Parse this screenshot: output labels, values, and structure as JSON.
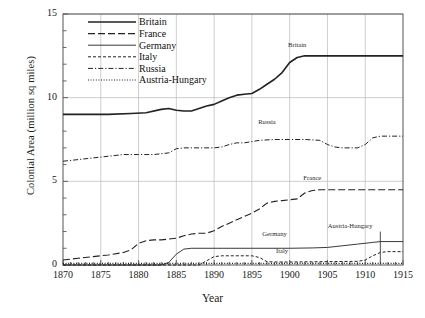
{
  "chart_data": {
    "type": "line",
    "title": "",
    "xlabel": "Year",
    "ylabel": "Colonial Area (million sq miles)",
    "xlim": [
      1870,
      1915
    ],
    "ylim": [
      0,
      15
    ],
    "xticks": [
      1870,
      1875,
      1880,
      1885,
      1890,
      1895,
      1900,
      1905,
      1910,
      1915
    ],
    "yticks": [
      0,
      5,
      10,
      15
    ],
    "yminor_step": 1,
    "grid": "vertical-and-horizontal-major",
    "legend_position": "top-left-inside",
    "series": [
      {
        "name": "Britain",
        "style": "solid-thick",
        "annotation": "Britain",
        "points": [
          [
            1870,
            9.0
          ],
          [
            1873,
            9.0
          ],
          [
            1876,
            9.0
          ],
          [
            1879,
            9.05
          ],
          [
            1881,
            9.1
          ],
          [
            1883,
            9.3
          ],
          [
            1884,
            9.35
          ],
          [
            1885,
            9.25
          ],
          [
            1886,
            9.2
          ],
          [
            1887,
            9.2
          ],
          [
            1888,
            9.35
          ],
          [
            1889,
            9.5
          ],
          [
            1890,
            9.6
          ],
          [
            1891,
            9.8
          ],
          [
            1892,
            10.0
          ],
          [
            1893,
            10.15
          ],
          [
            1894,
            10.2
          ],
          [
            1895,
            10.25
          ],
          [
            1896,
            10.5
          ],
          [
            1897,
            10.8
          ],
          [
            1898,
            11.1
          ],
          [
            1899,
            11.5
          ],
          [
            1900,
            12.1
          ],
          [
            1901,
            12.4
          ],
          [
            1902,
            12.5
          ],
          [
            1905,
            12.5
          ],
          [
            1910,
            12.5
          ],
          [
            1915,
            12.5
          ]
        ]
      },
      {
        "name": "France",
        "style": "long-dash",
        "annotation": "France",
        "points": [
          [
            1870,
            0.3
          ],
          [
            1872,
            0.4
          ],
          [
            1874,
            0.5
          ],
          [
            1876,
            0.6
          ],
          [
            1878,
            0.75
          ],
          [
            1879,
            0.9
          ],
          [
            1880,
            1.3
          ],
          [
            1881,
            1.45
          ],
          [
            1882,
            1.5
          ],
          [
            1883,
            1.5
          ],
          [
            1884,
            1.55
          ],
          [
            1885,
            1.6
          ],
          [
            1886,
            1.75
          ],
          [
            1887,
            1.85
          ],
          [
            1888,
            1.9
          ],
          [
            1889,
            1.9
          ],
          [
            1890,
            2.05
          ],
          [
            1891,
            2.3
          ],
          [
            1892,
            2.5
          ],
          [
            1893,
            2.7
          ],
          [
            1894,
            2.9
          ],
          [
            1895,
            3.1
          ],
          [
            1896,
            3.35
          ],
          [
            1897,
            3.7
          ],
          [
            1898,
            3.8
          ],
          [
            1899,
            3.85
          ],
          [
            1900,
            3.9
          ],
          [
            1901,
            3.95
          ],
          [
            1902,
            4.3
          ],
          [
            1903,
            4.45
          ],
          [
            1904,
            4.5
          ],
          [
            1906,
            4.5
          ],
          [
            1910,
            4.5
          ],
          [
            1915,
            4.5
          ]
        ]
      },
      {
        "name": "Germany",
        "style": "solid-thin",
        "annotation": "Germany",
        "points": [
          [
            1870,
            0.0
          ],
          [
            1883,
            0.0
          ],
          [
            1884,
            0.15
          ],
          [
            1885,
            0.65
          ],
          [
            1886,
            0.95
          ],
          [
            1887,
            1.0
          ],
          [
            1890,
            1.0
          ],
          [
            1895,
            1.0
          ],
          [
            1900,
            1.0
          ],
          [
            1903,
            1.02
          ],
          [
            1905,
            1.05
          ],
          [
            1907,
            1.15
          ],
          [
            1909,
            1.25
          ],
          [
            1911,
            1.35
          ],
          [
            1912,
            1.4
          ],
          [
            1915,
            1.4
          ]
        ]
      },
      {
        "name": "Italy",
        "style": "short-dash",
        "annotation": "Italy",
        "points": [
          [
            1870,
            0.0
          ],
          [
            1888,
            0.0
          ],
          [
            1889,
            0.25
          ],
          [
            1890,
            0.5
          ],
          [
            1891,
            0.55
          ],
          [
            1894,
            0.55
          ],
          [
            1895,
            0.55
          ],
          [
            1896,
            0.45
          ],
          [
            1897,
            0.2
          ],
          [
            1898,
            0.18
          ],
          [
            1900,
            0.18
          ],
          [
            1905,
            0.2
          ],
          [
            1909,
            0.22
          ],
          [
            1910,
            0.3
          ],
          [
            1911,
            0.55
          ],
          [
            1912,
            0.75
          ],
          [
            1913,
            0.8
          ],
          [
            1915,
            0.8
          ]
        ]
      },
      {
        "name": "Russia",
        "style": "dash-dot",
        "annotation": "Russia",
        "points": [
          [
            1870,
            6.2
          ],
          [
            1872,
            6.3
          ],
          [
            1874,
            6.4
          ],
          [
            1876,
            6.5
          ],
          [
            1878,
            6.6
          ],
          [
            1880,
            6.6
          ],
          [
            1882,
            6.6
          ],
          [
            1884,
            6.7
          ],
          [
            1885,
            6.95
          ],
          [
            1886,
            7.0
          ],
          [
            1888,
            7.0
          ],
          [
            1890,
            7.0
          ],
          [
            1891,
            7.05
          ],
          [
            1892,
            7.2
          ],
          [
            1893,
            7.3
          ],
          [
            1894,
            7.3
          ],
          [
            1896,
            7.45
          ],
          [
            1898,
            7.5
          ],
          [
            1900,
            7.5
          ],
          [
            1902,
            7.5
          ],
          [
            1904,
            7.45
          ],
          [
            1905,
            7.2
          ],
          [
            1906,
            7.05
          ],
          [
            1907,
            7.0
          ],
          [
            1909,
            7.0
          ],
          [
            1910,
            7.2
          ],
          [
            1911,
            7.6
          ],
          [
            1912,
            7.7
          ],
          [
            1915,
            7.7
          ]
        ]
      },
      {
        "name": "Austria-Hungary",
        "style": "dotted",
        "annotation": "Austria-Hungary",
        "points": [
          [
            1870,
            0.1
          ],
          [
            1880,
            0.1
          ],
          [
            1890,
            0.1
          ],
          [
            1900,
            0.1
          ],
          [
            1910,
            0.1
          ],
          [
            1915,
            0.1
          ]
        ]
      }
    ],
    "legend": [
      {
        "label": "Britain",
        "style": "solid-thick"
      },
      {
        "label": "France",
        "style": "long-dash"
      },
      {
        "label": "Germany",
        "style": "solid-thin"
      },
      {
        "label": "Italy",
        "style": "short-dash"
      },
      {
        "label": "Russia",
        "style": "dash-dot"
      },
      {
        "label": "Austria-Hungary",
        "style": "dotted"
      }
    ],
    "annotations": [
      {
        "text": "Britain",
        "x": 1901,
        "y": 13.0
      },
      {
        "text": "Russia",
        "x": 1897,
        "y": 8.4
      },
      {
        "text": "France",
        "x": 1903,
        "y": 5.1
      },
      {
        "text": "Germany",
        "x": 1898,
        "y": 1.75
      },
      {
        "text": "Italy",
        "x": 1899,
        "y": 0.7
      },
      {
        "text": "Austria-Hungary",
        "x": 1908,
        "y": 2.2
      }
    ],
    "colors": {
      "line": "#222222",
      "grid": "#b9b9b9",
      "frame": "#555555",
      "background": "#ffffff"
    }
  }
}
